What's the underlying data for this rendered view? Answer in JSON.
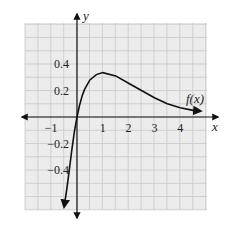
{
  "chart_data": {
    "type": "line",
    "title": "",
    "xlabel": "x",
    "ylabel": "y",
    "xlim": [
      -2,
      5.2
    ],
    "ylim": [
      -0.7,
      0.7
    ],
    "grid": true,
    "x_ticks": [
      -1,
      1,
      2,
      3,
      4
    ],
    "x_tick_labels": [
      "−1",
      "1",
      "2",
      "3",
      "4"
    ],
    "y_ticks": [
      0.4,
      0.2,
      -0.2,
      -0.4
    ],
    "y_tick_labels": [
      "0.4",
      "0.2",
      "−0.2",
      "−0.4"
    ],
    "series": [
      {
        "name": "f(x)",
        "label": "f(x)",
        "x": [
          -0.5,
          -0.4,
          -0.3,
          -0.2,
          -0.1,
          0,
          0.1,
          0.2,
          0.3,
          0.5,
          0.75,
          1,
          1.5,
          2,
          2.5,
          3,
          3.5,
          4,
          4.5,
          4.8
        ],
        "values": [
          -0.68,
          -0.55,
          -0.4,
          -0.25,
          -0.11,
          0,
          0.09,
          0.16,
          0.21,
          0.28,
          0.32,
          0.335,
          0.31,
          0.255,
          0.2,
          0.145,
          0.1,
          0.07,
          0.05,
          0.045
        ]
      }
    ],
    "annotations": [
      "f(x)"
    ]
  },
  "labels": {
    "x_axis": "x",
    "y_axis": "y",
    "curve": "f(x)"
  }
}
